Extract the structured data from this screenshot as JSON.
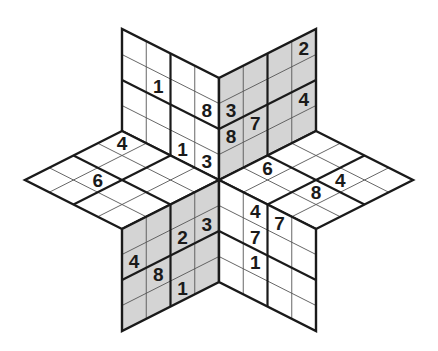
{
  "puzzle": {
    "type": "star-sudoku",
    "center": [
      219,
      180
    ],
    "grid_size": 4,
    "colors": {
      "white_panel": "#ffffff",
      "grey_panel": "#d4d4d4",
      "thin_line": "#555555",
      "thick_line": "#1a1a1a",
      "digit": "#1a1a1a"
    },
    "panels": [
      {
        "name": "top-left",
        "fill": "white",
        "vec_col": [
          -97,
          -49
        ],
        "vec_row": [
          0,
          -102
        ],
        "row_from_far": true,
        "givens": [
          {
            "col": 0,
            "row": 1,
            "value": "8"
          },
          {
            "col": 2,
            "row": 1,
            "value": "1"
          },
          {
            "col": 1,
            "row": 3,
            "value": "1"
          },
          {
            "col": 0,
            "row": 3,
            "value": "3"
          }
        ]
      },
      {
        "name": "top-right",
        "fill": "grey",
        "vec_col": [
          97,
          -49
        ],
        "vec_row": [
          0,
          -102
        ],
        "row_from_far": true,
        "givens": [
          {
            "col": 3,
            "row": 0,
            "value": "2"
          },
          {
            "col": 0,
            "row": 1,
            "value": "3"
          },
          {
            "col": 0,
            "row": 2,
            "value": "8"
          },
          {
            "col": 1,
            "row": 2,
            "value": "7"
          },
          {
            "col": 3,
            "row": 2,
            "value": "4"
          }
        ]
      },
      {
        "name": "left",
        "fill": "white",
        "vec_col": [
          -97,
          -49
        ],
        "vec_row": [
          -97,
          49
        ],
        "row_from_far": false,
        "givens": [
          {
            "col": 3,
            "row": 0,
            "value": "4"
          },
          {
            "col": 2,
            "row": 2,
            "value": "6"
          }
        ]
      },
      {
        "name": "right",
        "fill": "white",
        "vec_col": [
          97,
          -49
        ],
        "vec_row": [
          97,
          49
        ],
        "row_from_far": false,
        "givens": [
          {
            "col": 1,
            "row": 0,
            "value": "6"
          },
          {
            "col": 1,
            "row": 2,
            "value": "8"
          },
          {
            "col": 2,
            "row": 2,
            "value": "4"
          }
        ]
      },
      {
        "name": "bottom-left",
        "fill": "grey",
        "vec_col": [
          -97,
          49
        ],
        "vec_row": [
          0,
          102
        ],
        "row_from_far": false,
        "givens": [
          {
            "col": 1,
            "row": 1,
            "value": "2"
          },
          {
            "col": 0,
            "row": 1,
            "value": "3"
          },
          {
            "col": 3,
            "row": 1,
            "value": "4"
          },
          {
            "col": 2,
            "row": 2,
            "value": "8"
          },
          {
            "col": 1,
            "row": 3,
            "value": "1"
          }
        ]
      },
      {
        "name": "bottom-right",
        "fill": "white",
        "vec_col": [
          97,
          49
        ],
        "vec_row": [
          0,
          102
        ],
        "row_from_far": false,
        "givens": [
          {
            "col": 1,
            "row": 0,
            "value": "4"
          },
          {
            "col": 2,
            "row": 0,
            "value": "7"
          },
          {
            "col": 1,
            "row": 1,
            "value": "7"
          },
          {
            "col": 1,
            "row": 2,
            "value": "1"
          }
        ]
      }
    ]
  }
}
